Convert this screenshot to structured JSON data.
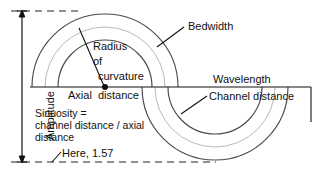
{
  "diagram": {
    "accent_color": "#111111",
    "channel_line_color": "#4a4a4a",
    "centerline_color": "#9a9a9a",
    "background": "#ffffff",
    "labels": {
      "amplitude": "Amplitude",
      "bedwidth": "Bedwidth",
      "radius_line1": "Radius",
      "radius_line2": "of",
      "radius_line3": "curvature",
      "axial_distance": "Axial  distance",
      "wavelength": "Wavelength",
      "channel_distance": "Channel distance",
      "sinuosity_line1": "Sinuosity =",
      "sinuosity_line2": "channel distance / axial",
      "sinuosity_line3": "distance",
      "here_value": "Here, 1.57"
    },
    "values": {
      "sinuosity": "1.57"
    },
    "geometry": {
      "center_upper_x": 105,
      "center_lower_x": 215,
      "axis_y": 87,
      "inner_radius": 47,
      "outer_radius": 73,
      "amplitude_top_y": 11,
      "amplitude_bottom_y": 162
    }
  }
}
